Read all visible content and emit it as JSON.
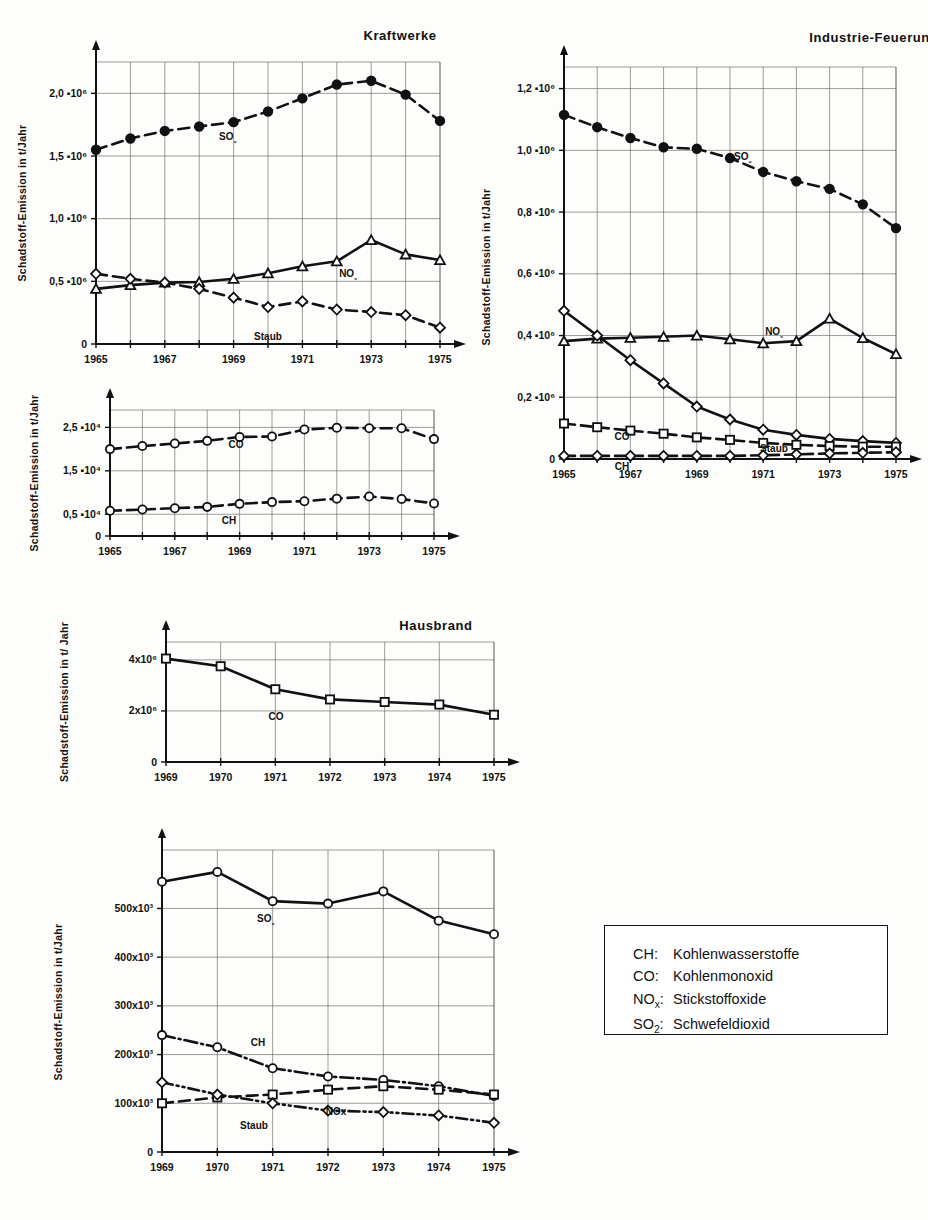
{
  "legend": {
    "rows": [
      {
        "key": "CH:",
        "desc": "Kohlenwasserstoffe"
      },
      {
        "key": "CO:",
        "desc": "Kohlenmonoxid"
      },
      {
        "key": "NOx:",
        "desc": "Stickstoffoxide"
      },
      {
        "key": "SO2:",
        "desc": "Schwefeldioxid"
      }
    ]
  },
  "chart_data": [
    {
      "id": "kraftwerke-main",
      "type": "line",
      "title": "Kraftwerke",
      "ylabel": "Schadstoff-Emission in t/Jahr",
      "xlabel": "",
      "x": [
        1965,
        1966,
        1967,
        1968,
        1969,
        1970,
        1971,
        1972,
        1973,
        1974,
        1975
      ],
      "xticklabels": [
        "1965",
        "",
        "1967",
        "",
        "1969",
        "",
        "1971",
        "",
        "1973",
        "",
        "1975"
      ],
      "xlim": [
        1965,
        1975
      ],
      "ylim": [
        0,
        2250000
      ],
      "yticks": [
        0,
        500000,
        1000000,
        1500000,
        2000000
      ],
      "yticklabels": [
        "0",
        "0,5 ▪10⁶",
        "1,0 ▪10⁶",
        "1,5 ▪10⁶",
        "2,0 ▪10⁶"
      ],
      "grid": true,
      "series": [
        {
          "name": "SO2",
          "label": "SO₂",
          "marker": "filled-circle",
          "dash": "dashed",
          "values": [
            1550000,
            1640000,
            1700000,
            1735000,
            1770000,
            1855000,
            1960000,
            2070000,
            2100000,
            1990000,
            1780000
          ]
        },
        {
          "name": "NOx",
          "label": "NOₓ",
          "marker": "triangle",
          "dash": "solid",
          "values": [
            440000,
            470000,
            490000,
            495000,
            520000,
            565000,
            620000,
            660000,
            830000,
            715000,
            670000
          ]
        },
        {
          "name": "Staub",
          "label": "Staub",
          "marker": "diamond",
          "dash": "dashed",
          "values": [
            560000,
            520000,
            490000,
            440000,
            370000,
            295000,
            340000,
            275000,
            255000,
            230000,
            130000
          ]
        }
      ]
    },
    {
      "id": "industrie",
      "type": "line",
      "title": "Industrie-Feuerungen",
      "ylabel": "Schadstoff-Emission in t/Jahr",
      "xlabel": "",
      "x": [
        1965,
        1966,
        1967,
        1968,
        1969,
        1970,
        1971,
        1972,
        1973,
        1974,
        1975
      ],
      "xticklabels": [
        "1965",
        "",
        "1967",
        "",
        "1969",
        "",
        "1971",
        "",
        "1973",
        "",
        "1975"
      ],
      "xlim": [
        1965,
        1975
      ],
      "ylim": [
        0,
        1270000
      ],
      "yticks": [
        0,
        200000,
        400000,
        600000,
        800000,
        1000000,
        1200000
      ],
      "yticklabels": [
        "0",
        "0,2 ▪10⁶",
        "0,4 ▪10⁶",
        "0,6 ▪10⁶",
        "0,8 ▪10⁶",
        "1,0 ▪10⁶",
        "1,2 ▪10⁶"
      ],
      "grid": true,
      "series": [
        {
          "name": "SO2",
          "label": "SO₂",
          "marker": "filled-circle",
          "dash": "dashed",
          "values": [
            1115000,
            1075000,
            1040000,
            1010000,
            1005000,
            975000,
            930000,
            900000,
            875000,
            825000,
            748000
          ]
        },
        {
          "name": "NOx",
          "label": "NOₓ",
          "marker": "triangle",
          "dash": "solid",
          "values": [
            382000,
            390000,
            393000,
            396000,
            400000,
            388000,
            375000,
            382000,
            455000,
            392000,
            340000
          ]
        },
        {
          "name": "Staub",
          "label": "Staub",
          "marker": "diamond",
          "dash": "solid",
          "values": [
            480000,
            400000,
            320000,
            245000,
            170000,
            128000,
            95000,
            78000,
            65000,
            58000,
            52000
          ]
        },
        {
          "name": "CO",
          "label": "CO",
          "marker": "square",
          "dash": "dashed",
          "values": [
            115000,
            103000,
            92000,
            82000,
            70000,
            62000,
            52000,
            46000,
            42000,
            40000,
            40000
          ]
        },
        {
          "name": "CH",
          "label": "CH",
          "marker": "diamond",
          "dash": "dashed",
          "values": [
            10000,
            10000,
            10000,
            10000,
            10000,
            10000,
            12000,
            15000,
            18000,
            20000,
            22000
          ]
        }
      ]
    },
    {
      "id": "kraftwerke-co-ch",
      "type": "line",
      "title": "",
      "ylabel": "Schadstoff-Emission in t/Jahr",
      "xlabel": "",
      "x": [
        1965,
        1966,
        1967,
        1968,
        1969,
        1970,
        1971,
        1972,
        1973,
        1974,
        1975
      ],
      "xticklabels": [
        "1965",
        "",
        "1967",
        "",
        "1969",
        "",
        "1971",
        "",
        "1973",
        "",
        "1975"
      ],
      "xlim": [
        1965,
        1975
      ],
      "ylim": [
        0,
        29000
      ],
      "yticks": [
        0,
        5000,
        15000,
        25000
      ],
      "yticklabels": [
        "0",
        "0,5 ▪10⁴",
        "1,5 ▪10⁴",
        "2,5 ▪10⁴"
      ],
      "grid": true,
      "series": [
        {
          "name": "CO",
          "label": "CO",
          "marker": "circle",
          "dash": "dashed",
          "values": [
            20000,
            20700,
            21300,
            21900,
            22800,
            22900,
            24500,
            24900,
            24800,
            24800,
            22300
          ]
        },
        {
          "name": "CH",
          "label": "CH",
          "marker": "circle",
          "dash": "dashed",
          "values": [
            5800,
            6100,
            6400,
            6700,
            7400,
            7800,
            8000,
            8600,
            9100,
            8500,
            7500
          ]
        }
      ]
    },
    {
      "id": "hausbrand-co",
      "type": "line",
      "title": "Hausbrand",
      "ylabel": "Schadstoff-Emission in t/ Jahr",
      "xlabel": "",
      "x": [
        1969,
        1970,
        1971,
        1972,
        1973,
        1974,
        1975
      ],
      "xticklabels": [
        "1969",
        "1970",
        "1971",
        "1972",
        "1973",
        "1974",
        "1975"
      ],
      "xlim": [
        1969,
        1975
      ],
      "ylim": [
        0,
        4700000
      ],
      "yticks": [
        0,
        2000000,
        4000000
      ],
      "yticklabels": [
        "0",
        "2x10⁶",
        "4x10⁶"
      ],
      "grid": true,
      "series": [
        {
          "name": "CO",
          "label": "CO",
          "marker": "square",
          "dash": "solid",
          "values": [
            4050000,
            3750000,
            2850000,
            2450000,
            2350000,
            2250000,
            1850000
          ]
        }
      ]
    },
    {
      "id": "hausbrand-other",
      "type": "line",
      "title": "",
      "ylabel": "Schadstoff-Emission in t/Jahr",
      "xlabel": "",
      "x": [
        1969,
        1970,
        1971,
        1972,
        1973,
        1974,
        1975
      ],
      "xticklabels": [
        "1969",
        "1970",
        "1971",
        "1972",
        "1973",
        "1974",
        "1975"
      ],
      "xlim": [
        1969,
        1975
      ],
      "ylim": [
        0,
        620000
      ],
      "yticks": [
        0,
        100000,
        200000,
        300000,
        400000,
        500000
      ],
      "yticklabels": [
        "0",
        "100x10³",
        "200x10³",
        "300x10³",
        "400x10³",
        "500x10³"
      ],
      "grid": true,
      "series": [
        {
          "name": "SO2",
          "label": "SO₂",
          "marker": "circle",
          "dash": "solid",
          "values": [
            555000,
            575000,
            515000,
            510000,
            535000,
            475000,
            447000
          ]
        },
        {
          "name": "CH",
          "label": "CH",
          "marker": "circle",
          "dash": "dashdot",
          "values": [
            240000,
            215000,
            172000,
            155000,
            148000,
            135000,
            115000
          ]
        },
        {
          "name": "NOx",
          "label": "NOx",
          "marker": "square",
          "dash": "dashed",
          "values": [
            100000,
            112000,
            118000,
            128000,
            135000,
            128000,
            118000
          ]
        },
        {
          "name": "Staub",
          "label": "Staub",
          "marker": "diamond",
          "dash": "dashdotdot",
          "values": [
            143000,
            118000,
            100000,
            85000,
            82000,
            75000,
            60000
          ]
        }
      ]
    }
  ]
}
